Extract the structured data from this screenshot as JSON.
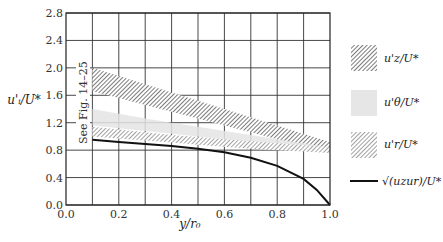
{
  "chart_data": {
    "type": "area",
    "title": "",
    "xlabel": "y/r0",
    "ylabel": "u'_i/U*",
    "xlim": [
      0.0,
      1.0
    ],
    "ylim": [
      0.0,
      2.8
    ],
    "x_ticks": [
      "0.0",
      "0.2",
      "0.4",
      "0.6",
      "0.8",
      "1.0"
    ],
    "y_ticks": [
      "0.0",
      "0.4",
      "0.8",
      "1.2",
      "1.6",
      "2.0",
      "2.4",
      "2.8"
    ],
    "grid": true,
    "legend_position": "right",
    "annotation": "See Fig. 14-25",
    "series": [
      {
        "name": "u'_z/U*",
        "kind": "band",
        "style": "dense-hatch",
        "x": [
          0.1,
          0.2,
          0.3,
          0.4,
          0.5,
          0.6,
          0.7,
          0.8,
          0.9,
          1.0
        ],
        "upper": [
          2.0,
          1.88,
          1.76,
          1.64,
          1.52,
          1.4,
          1.28,
          1.16,
          1.04,
          0.92
        ],
        "lower": [
          1.66,
          1.56,
          1.46,
          1.36,
          1.26,
          1.16,
          1.06,
          0.96,
          0.86,
          0.78
        ]
      },
      {
        "name": "u'_theta/U*",
        "kind": "band",
        "style": "light-gray",
        "x": [
          0.1,
          0.2,
          0.3,
          0.4,
          0.5,
          0.6,
          0.7,
          0.8,
          0.9,
          1.0
        ],
        "upper": [
          1.4,
          1.33,
          1.26,
          1.2,
          1.14,
          1.08,
          1.02,
          0.96,
          0.9,
          0.84
        ],
        "lower": [
          1.16,
          1.12,
          1.08,
          1.04,
          1.0,
          0.96,
          0.92,
          0.88,
          0.84,
          0.8
        ]
      },
      {
        "name": "u'_r/U*",
        "kind": "band",
        "style": "hatch",
        "x": [
          0.1,
          0.2,
          0.3,
          0.4,
          0.5,
          0.6,
          0.7,
          0.8,
          0.9,
          1.0
        ],
        "upper": [
          1.14,
          1.1,
          1.06,
          1.02,
          0.99,
          0.96,
          0.93,
          0.9,
          0.87,
          0.84
        ],
        "lower": [
          1.0,
          0.97,
          0.94,
          0.91,
          0.88,
          0.85,
          0.82,
          0.8,
          0.78,
          0.76
        ]
      },
      {
        "name": "sqrt(u_z u_r)/U*",
        "kind": "line",
        "x": [
          0.1,
          0.2,
          0.3,
          0.4,
          0.5,
          0.6,
          0.7,
          0.8,
          0.9,
          0.95,
          1.0
        ],
        "y": [
          0.95,
          0.92,
          0.89,
          0.86,
          0.82,
          0.77,
          0.69,
          0.57,
          0.38,
          0.22,
          0.0
        ]
      }
    ]
  },
  "legend": {
    "items": [
      {
        "label": "u'z/U*"
      },
      {
        "label": "u'θ/U*"
      },
      {
        "label": "u'r/U*"
      },
      {
        "label": "√(uzur)/U*"
      }
    ]
  },
  "axes": {
    "xlabel": "y/r₀",
    "ylabel": "u'ᵢ/U*",
    "annotation": "See Fig. 14–25"
  }
}
